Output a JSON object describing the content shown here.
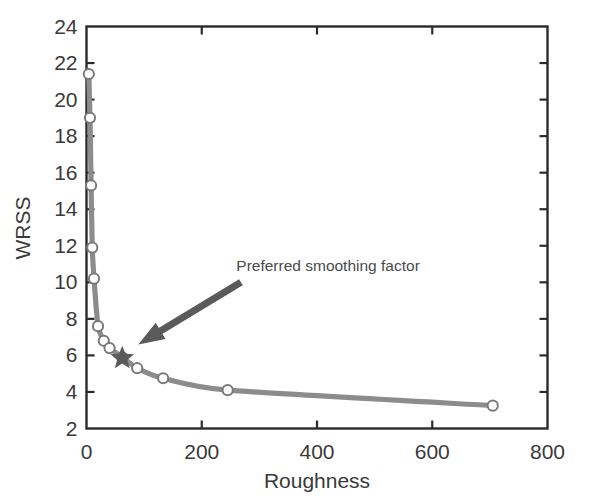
{
  "chart_data": {
    "type": "line",
    "title": "",
    "xlabel": "Roughness",
    "ylabel": "WRSS",
    "xlim": [
      0,
      800
    ],
    "ylim": [
      2,
      24
    ],
    "xticks": [
      0,
      200,
      400,
      600,
      800
    ],
    "yticks": [
      2,
      4,
      6,
      8,
      10,
      12,
      14,
      16,
      18,
      20,
      22,
      24
    ],
    "xtick_labels": [
      "0",
      "200",
      "400",
      "600",
      "800"
    ],
    "ytick_labels": [
      "2",
      "4",
      "6",
      "8",
      "10",
      "12",
      "14",
      "16",
      "18",
      "20",
      "22",
      "24"
    ],
    "grid": false,
    "legend": "none",
    "series": [
      {
        "name": "L-curve",
        "marker": "open-circle",
        "line_color": "#8c8c8c",
        "marker_face_color": "#ffffff",
        "marker_edge_color": "#7a7a7a",
        "x": [
          4,
          6,
          8,
          10,
          13,
          20,
          30,
          40,
          62,
          88,
          133,
          245,
          705
        ],
        "y": [
          21.4,
          19.0,
          15.3,
          11.9,
          10.2,
          7.6,
          6.8,
          6.4,
          5.9,
          5.3,
          4.75,
          4.1,
          3.25
        ]
      }
    ],
    "highlight": {
      "name": "preferred-smoothing-factor",
      "marker": "star",
      "color": "#5a5a5a",
      "x": 62,
      "y": 5.85
    },
    "annotations": [
      {
        "name": "preferred-smoothing-factor-label",
        "text": "Preferred smoothing factor",
        "text_x": 260,
        "text_y": 10.6,
        "arrow_from_x": 268,
        "arrow_from_y": 10.0,
        "arrow_to_x": 90,
        "arrow_to_y": 6.6,
        "arrow_color": "#5a5a5a"
      }
    ]
  },
  "colors": {
    "axis": "#2b2b2b",
    "line": "#8c8c8c",
    "marker_edge": "#7a7a7a",
    "marker_face": "#ffffff",
    "star": "#5a5a5a",
    "arrow": "#5a5a5a",
    "text": "#3a3a3a",
    "background": "#ffffff"
  }
}
